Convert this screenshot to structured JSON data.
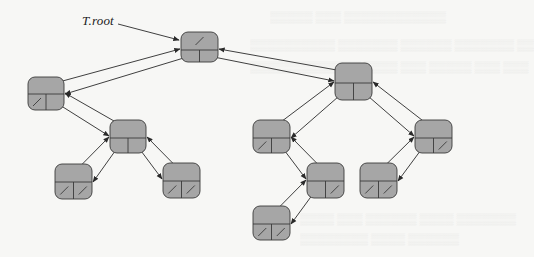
{
  "diagram": {
    "root_label": "T.root",
    "colors": {
      "node_fill": "#a6a6a6",
      "node_stroke": "#3a3a3a",
      "edge": "#2a2a2a",
      "background": "#f7f7f5"
    },
    "nodes": [
      {
        "id": "root",
        "x": 181,
        "y": 32,
        "w": 37,
        "h": 30,
        "split": 18,
        "parent_null": true,
        "left_null": false,
        "right_null": false
      },
      {
        "id": "a",
        "x": 28,
        "y": 77,
        "w": 36,
        "h": 33,
        "split": 17,
        "parent_null": false,
        "left_null": true,
        "right_null": false
      },
      {
        "id": "b",
        "x": 335,
        "y": 63,
        "w": 37,
        "h": 37,
        "split": 20,
        "parent_null": false,
        "left_null": false,
        "right_null": false
      },
      {
        "id": "c",
        "x": 110,
        "y": 120,
        "w": 36,
        "h": 33,
        "split": 18,
        "parent_null": false,
        "left_null": false,
        "right_null": false
      },
      {
        "id": "c_l",
        "x": 55,
        "y": 164,
        "w": 37,
        "h": 35,
        "split": 18,
        "parent_null": false,
        "left_null": true,
        "right_null": true
      },
      {
        "id": "c_r",
        "x": 163,
        "y": 163,
        "w": 37,
        "h": 35,
        "split": 18,
        "parent_null": false,
        "left_null": true,
        "right_null": true
      },
      {
        "id": "d",
        "x": 253,
        "y": 120,
        "w": 37,
        "h": 33,
        "split": 18,
        "parent_null": false,
        "left_null": true,
        "right_null": false
      },
      {
        "id": "e",
        "x": 415,
        "y": 120,
        "w": 37,
        "h": 33,
        "split": 18,
        "parent_null": false,
        "left_null": false,
        "right_null": true
      },
      {
        "id": "f",
        "x": 307,
        "y": 163,
        "w": 37,
        "h": 35,
        "split": 18,
        "parent_null": false,
        "left_null": false,
        "right_null": true
      },
      {
        "id": "e_l",
        "x": 360,
        "y": 163,
        "w": 37,
        "h": 35,
        "split": 18,
        "parent_null": false,
        "left_null": true,
        "right_null": true
      },
      {
        "id": "f_l",
        "x": 253,
        "y": 206,
        "w": 37,
        "h": 34,
        "split": 18,
        "parent_null": false,
        "left_null": true,
        "right_null": true
      }
    ],
    "edges": [
      {
        "parent": "root",
        "child": "a",
        "side": "left"
      },
      {
        "parent": "root",
        "child": "b",
        "side": "right"
      },
      {
        "parent": "a",
        "child": "c",
        "side": "right"
      },
      {
        "parent": "c",
        "child": "c_l",
        "side": "left"
      },
      {
        "parent": "c",
        "child": "c_r",
        "side": "right"
      },
      {
        "parent": "b",
        "child": "d",
        "side": "left"
      },
      {
        "parent": "b",
        "child": "e",
        "side": "right"
      },
      {
        "parent": "d",
        "child": "f",
        "side": "right"
      },
      {
        "parent": "e",
        "child": "e_l",
        "side": "left"
      },
      {
        "parent": "f",
        "child": "f_l",
        "side": "left"
      }
    ]
  }
}
